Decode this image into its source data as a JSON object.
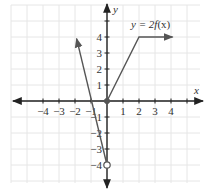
{
  "chart_data": {
    "type": "line",
    "title": "",
    "xlabel": "x",
    "ylabel": "y",
    "xlim": [
      -5.9,
      5.9
    ],
    "ylim": [
      -5.2,
      5.9
    ],
    "grid": true,
    "x_ticks": [
      -4,
      -3,
      -2,
      -1,
      1,
      2,
      3,
      4,
      5
    ],
    "x_tick_labels": [
      "−4",
      "−3",
      "−2",
      "−1",
      "1",
      "2",
      "3",
      "4",
      ""
    ],
    "y_ticks": [
      -4,
      -3,
      -2,
      -1,
      1,
      2,
      3,
      4,
      5
    ],
    "y_tick_labels": [
      "−4",
      "−3",
      "−2",
      "−1",
      "1",
      "2",
      "3",
      "4",
      ""
    ],
    "series": [
      {
        "name": "y = 2f(x)",
        "segments": [
          {
            "points": [
              [
                0,
                -4
              ],
              [
                -1.9,
                3.9
              ]
            ],
            "start": "open",
            "end": "arrow"
          },
          {
            "points": [
              [
                0,
                0
              ],
              [
                2,
                4
              ],
              [
                4.1,
                4
              ]
            ],
            "start": "closed",
            "end": "arrow"
          }
        ]
      }
    ],
    "annotations": [
      {
        "text": "y = 2f(x)",
        "x": 2.5,
        "y": 4.7
      },
      {
        "text": "open-circle",
        "x": 0,
        "y": -4
      },
      {
        "text": "closed-dot",
        "x": 0,
        "y": 0
      }
    ]
  },
  "labels": {
    "x_axis": "x",
    "y_axis": "y",
    "function_prefix": "y = 2",
    "function_f": "f",
    "function_arg": "(x)"
  },
  "colors": {
    "axis": "#222222",
    "curve": "#555555",
    "grid": "#e6e6e6",
    "text": "#333333"
  }
}
